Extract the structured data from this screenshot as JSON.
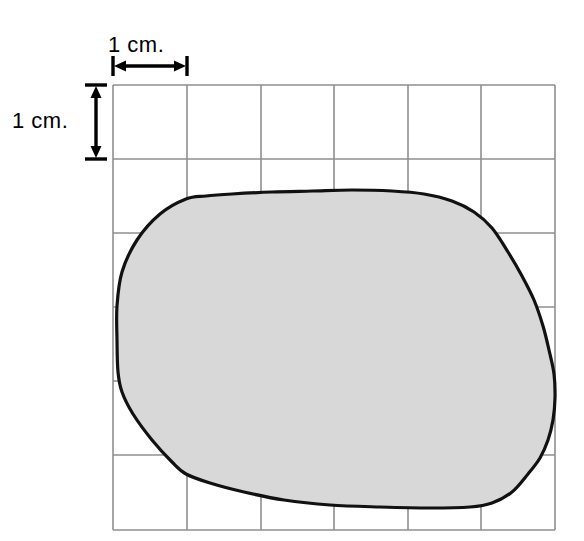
{
  "figure": {
    "type": "area-estimation-grid-diagram",
    "background_color": "#ffffff",
    "grid": {
      "label": "centimeter-grid",
      "columns": 6,
      "rows": 6,
      "cell_size_px": 74,
      "cell_size_label": "1 cm.",
      "left_px": 113,
      "top_px": 85,
      "right_px": 555,
      "bottom_px": 530,
      "line_color": "#8f8f8f",
      "line_width_px": 1.6,
      "x_lines_px": [
        113,
        187,
        261,
        334,
        408,
        481,
        555
      ],
      "y_lines_px": [
        85,
        159,
        233,
        307,
        381,
        455,
        530
      ]
    },
    "scale_bars": {
      "horizontal": {
        "name": "horizontal-scale-bar",
        "label": "1 cm.",
        "from_px": 113,
        "to_px": 187,
        "y_px": 66,
        "color": "#000000"
      },
      "vertical": {
        "name": "vertical-scale-bar",
        "label": "1 cm.",
        "from_px": 85,
        "to_px": 159,
        "x_px": 96,
        "color": "#000000"
      }
    },
    "blob": {
      "name": "irregular-region",
      "fill_color": "#d8d8d8",
      "stroke_color": "#111111",
      "stroke_width_px": 3.2,
      "approx_area_sq_cm": 22,
      "bounds_px": {
        "left": 116,
        "top": 190,
        "right": 556,
        "bottom": 508
      },
      "outline_points_px": [
        [
          186,
          199
        ],
        [
          160,
          214
        ],
        [
          137,
          240
        ],
        [
          122,
          272
        ],
        [
          117,
          306
        ],
        [
          117,
          340
        ],
        [
          118,
          372
        ],
        [
          122,
          392
        ],
        [
          133,
          414
        ],
        [
          152,
          440
        ],
        [
          172,
          462
        ],
        [
          186,
          474
        ],
        [
          210,
          483
        ],
        [
          244,
          492
        ],
        [
          284,
          500
        ],
        [
          330,
          505
        ],
        [
          380,
          507
        ],
        [
          430,
          508
        ],
        [
          470,
          507
        ],
        [
          492,
          503
        ],
        [
          512,
          492
        ],
        [
          528,
          474
        ],
        [
          540,
          458
        ],
        [
          548,
          440
        ],
        [
          553,
          420
        ],
        [
          555,
          398
        ],
        [
          554,
          374
        ],
        [
          549,
          350
        ],
        [
          543,
          326
        ],
        [
          534,
          300
        ],
        [
          522,
          276
        ],
        [
          508,
          252
        ],
        [
          492,
          228
        ],
        [
          474,
          212
        ],
        [
          452,
          201
        ],
        [
          424,
          194
        ],
        [
          392,
          191
        ],
        [
          352,
          190
        ],
        [
          312,
          191
        ],
        [
          272,
          192
        ],
        [
          232,
          194
        ],
        [
          206,
          196
        ]
      ]
    },
    "ghost_bleed_text": [
      {
        "text": "a of the triangle is",
        "x_px": 30,
        "y_px": 160,
        "font_size_px": 21
      },
      {
        "text": "is to change the leng",
        "x_px": 10,
        "y_px": 186,
        "font_size_px": 21
      },
      {
        "text": "C = area of the tri",
        "x_px": 56,
        "y_px": 214,
        "font_size_px": 21
      },
      {
        "text": "x  A = base of the tri",
        "x_px": 16,
        "y_px": 316,
        "font_size_px": 21
      },
      {
        "text": "= 28 in",
        "x_px": 40,
        "y_px": 354,
        "font_size_px": 21
      },
      {
        "text": "osa of the triangle is mea",
        "x_px": 10,
        "y_px": 424,
        "font_size_px": 21
      }
    ]
  }
}
